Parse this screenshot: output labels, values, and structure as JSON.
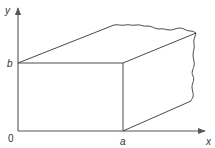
{
  "figure": {
    "axes": {
      "x_label": "x",
      "y_label": "y",
      "origin_label": "0"
    },
    "ticks": {
      "x_tick_label": "a",
      "y_tick_label": "b"
    },
    "colors": {
      "line": "#4a4a4a",
      "axis": "#555555",
      "text": "#333333",
      "background": "#ffffff"
    }
  }
}
